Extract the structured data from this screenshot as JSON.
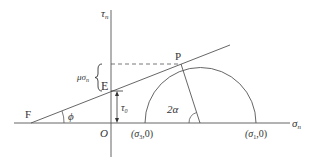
{
  "diagram": {
    "type": "Mohr circle with failure envelope",
    "colors": {
      "line": "#444444",
      "text": "#333333",
      "background": "#ffffff"
    },
    "axes": {
      "horizontal_label": "σ",
      "horizontal_sub": "n",
      "vertical_label": "τ",
      "vertical_sub": "n",
      "origin_label": "O"
    },
    "points": {
      "P": "P",
      "E": "E",
      "F": "F"
    },
    "annotations": {
      "mu_sigma": "μσ",
      "mu_sigma_sub": "n",
      "tau0": "τ",
      "tau0_sub": "0",
      "phi": "ϕ",
      "two_alpha": "2α",
      "sigma3_point": "(σ",
      "sigma3_sub": "3",
      "sigma3_tail": ",0)",
      "sigma1_point": "(σ",
      "sigma1_sub": "1",
      "sigma1_tail": ",0)"
    }
  }
}
